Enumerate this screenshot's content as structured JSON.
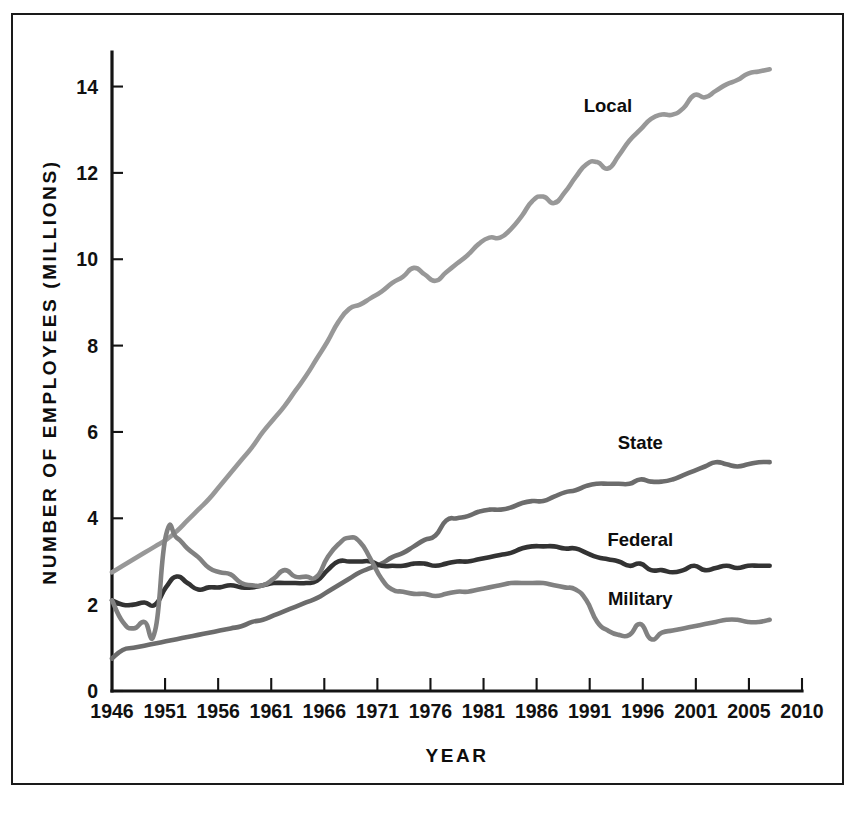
{
  "figure": {
    "background_color": "#ffffff",
    "border_color": "#1a1a1a"
  },
  "chart_data": {
    "type": "line",
    "title": "",
    "xlabel": "YEAR",
    "ylabel": "NUMBER OF EMPLOYEES (MILLIONS)",
    "xlim": [
      1946,
      2010
    ],
    "ylim": [
      0,
      14.8
    ],
    "yticks": [
      0,
      2,
      4,
      6,
      8,
      10,
      12,
      14
    ],
    "ytick_labels": [
      "0",
      "2",
      "4",
      "6",
      "8",
      "10",
      "12",
      "14"
    ],
    "xticks": [
      1946,
      1951,
      1956,
      1961,
      1966,
      1971,
      1976,
      1981,
      1986,
      1991,
      1996,
      2001,
      2005,
      2010
    ],
    "xtick_labels": [
      "1946",
      "1951",
      "1956",
      "1961",
      "1966",
      "1971",
      "1976",
      "1981",
      "1986",
      "1991",
      "1996",
      "2001",
      "2005",
      "2010"
    ],
    "grid": false,
    "legend_position": "inline-annotation",
    "series": [
      {
        "name": "Local",
        "label": "Local",
        "color": "#989898",
        "label_x": 1992,
        "label_y": 13.4,
        "x": [
          1946,
          1947,
          1948,
          1949,
          1950,
          1951,
          1952,
          1953,
          1954,
          1955,
          1956,
          1957,
          1958,
          1959,
          1960,
          1961,
          1962,
          1963,
          1964,
          1965,
          1966,
          1967,
          1968,
          1969,
          1970,
          1971,
          1972,
          1973,
          1974,
          1975,
          1976,
          1977,
          1978,
          1979,
          1980,
          1981,
          1982,
          1983,
          1984,
          1985,
          1986,
          1987,
          1988,
          1989,
          1990,
          1991,
          1992,
          1993,
          1994,
          1995,
          1996,
          1997,
          1998,
          1999,
          2000,
          2001,
          2002,
          2003,
          2004,
          2005,
          2006,
          2007
        ],
        "y": [
          2.75,
          2.9,
          3.05,
          3.2,
          3.35,
          3.5,
          3.7,
          3.95,
          4.2,
          4.45,
          4.75,
          5.05,
          5.35,
          5.65,
          6.0,
          6.3,
          6.6,
          6.95,
          7.3,
          7.7,
          8.1,
          8.55,
          8.85,
          8.95,
          9.1,
          9.25,
          9.45,
          9.6,
          9.8,
          9.65,
          9.5,
          9.7,
          9.9,
          10.1,
          10.35,
          10.5,
          10.5,
          10.7,
          11.0,
          11.35,
          11.45,
          11.3,
          11.55,
          11.9,
          12.2,
          12.25,
          12.1,
          12.4,
          12.75,
          13.0,
          13.25,
          13.35,
          13.35,
          13.5,
          13.8,
          13.75,
          13.9,
          14.05,
          14.15,
          14.3,
          14.35,
          14.4
        ]
      },
      {
        "name": "State",
        "label": "State",
        "color": "#6c6c6c",
        "label_x": 1995,
        "label_y": 5.6,
        "x": [
          1946,
          1947,
          1948,
          1949,
          1950,
          1951,
          1952,
          1953,
          1954,
          1955,
          1956,
          1957,
          1958,
          1959,
          1960,
          1961,
          1962,
          1963,
          1964,
          1965,
          1966,
          1967,
          1968,
          1969,
          1970,
          1971,
          1972,
          1973,
          1974,
          1975,
          1976,
          1977,
          1978,
          1979,
          1980,
          1981,
          1982,
          1983,
          1984,
          1985,
          1986,
          1987,
          1988,
          1989,
          1990,
          1991,
          1992,
          1993,
          1994,
          1995,
          1996,
          1997,
          1998,
          1999,
          2000,
          2001,
          2002,
          2003,
          2004,
          2005,
          2006,
          2007
        ],
        "y": [
          0.75,
          0.95,
          1.0,
          1.05,
          1.1,
          1.15,
          1.2,
          1.25,
          1.3,
          1.35,
          1.4,
          1.45,
          1.5,
          1.6,
          1.65,
          1.75,
          1.85,
          1.95,
          2.05,
          2.15,
          2.3,
          2.45,
          2.6,
          2.75,
          2.85,
          2.95,
          3.1,
          3.2,
          3.35,
          3.5,
          3.6,
          3.95,
          4.0,
          4.05,
          4.15,
          4.2,
          4.2,
          4.25,
          4.35,
          4.4,
          4.4,
          4.5,
          4.6,
          4.65,
          4.75,
          4.8,
          4.8,
          4.8,
          4.8,
          4.9,
          4.85,
          4.85,
          4.9,
          5.0,
          5.1,
          5.2,
          5.3,
          5.25,
          5.2,
          5.25,
          5.3,
          5.3
        ]
      },
      {
        "name": "Federal",
        "label": "Federal",
        "color": "#333333",
        "label_x": 1995,
        "label_y": 3.35,
        "x": [
          1946,
          1947,
          1948,
          1949,
          1950,
          1951,
          1952,
          1953,
          1954,
          1955,
          1956,
          1957,
          1958,
          1959,
          1960,
          1961,
          1962,
          1963,
          1964,
          1965,
          1966,
          1967,
          1968,
          1969,
          1970,
          1971,
          1972,
          1973,
          1974,
          1975,
          1976,
          1977,
          1978,
          1979,
          1980,
          1981,
          1982,
          1983,
          1984,
          1985,
          1986,
          1987,
          1988,
          1989,
          1990,
          1991,
          1992,
          1993,
          1994,
          1995,
          1996,
          1997,
          1998,
          1999,
          2000,
          2001,
          2002,
          2003,
          2004,
          2005,
          2006,
          2007
        ],
        "y": [
          2.1,
          2.0,
          2.0,
          2.05,
          2.0,
          2.4,
          2.65,
          2.5,
          2.35,
          2.4,
          2.4,
          2.45,
          2.4,
          2.4,
          2.45,
          2.5,
          2.5,
          2.5,
          2.5,
          2.55,
          2.8,
          3.0,
          3.0,
          3.0,
          3.0,
          2.9,
          2.9,
          2.9,
          2.95,
          2.95,
          2.9,
          2.95,
          3.0,
          3.0,
          3.05,
          3.1,
          3.15,
          3.2,
          3.3,
          3.35,
          3.35,
          3.35,
          3.3,
          3.3,
          3.2,
          3.1,
          3.05,
          3.0,
          2.9,
          2.95,
          2.8,
          2.8,
          2.75,
          2.8,
          2.9,
          2.8,
          2.85,
          2.9,
          2.85,
          2.9,
          2.9,
          2.9
        ]
      },
      {
        "name": "Military",
        "label": "Military",
        "color": "#818181",
        "label_x": 1995,
        "label_y": 2.0,
        "x": [
          1946,
          1947,
          1948,
          1949,
          1950,
          1951,
          1952,
          1953,
          1954,
          1955,
          1956,
          1957,
          1958,
          1959,
          1960,
          1961,
          1962,
          1963,
          1964,
          1965,
          1966,
          1967,
          1968,
          1969,
          1970,
          1971,
          1972,
          1973,
          1974,
          1975,
          1976,
          1977,
          1978,
          1979,
          1980,
          1981,
          1982,
          1983,
          1984,
          1985,
          1986,
          1987,
          1988,
          1989,
          1990,
          1991,
          1992,
          1993,
          1994,
          1995,
          1996,
          1997,
          1998,
          1999,
          2000,
          2001,
          2002,
          2003,
          2004,
          2005,
          2006,
          2007
        ],
        "y": [
          2.1,
          1.6,
          1.45,
          1.6,
          1.4,
          3.6,
          3.55,
          3.3,
          3.1,
          2.85,
          2.75,
          2.7,
          2.5,
          2.45,
          2.45,
          2.6,
          2.8,
          2.65,
          2.65,
          2.65,
          3.1,
          3.4,
          3.55,
          3.45,
          3.05,
          2.6,
          2.35,
          2.3,
          2.25,
          2.25,
          2.2,
          2.25,
          2.3,
          2.3,
          2.35,
          2.4,
          2.45,
          2.5,
          2.5,
          2.5,
          2.5,
          2.45,
          2.4,
          2.35,
          2.1,
          1.6,
          1.4,
          1.3,
          1.3,
          1.55,
          1.2,
          1.35,
          1.4,
          1.45,
          1.5,
          1.55,
          1.6,
          1.65,
          1.65,
          1.6,
          1.6,
          1.65
        ]
      }
    ]
  }
}
